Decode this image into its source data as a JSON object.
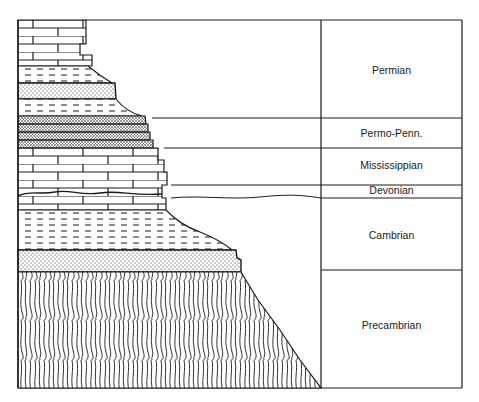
{
  "figure": {
    "type": "stratigraphic-column",
    "periods": [
      {
        "name": "Permian",
        "top": 20,
        "bottom": 118,
        "label_y": 64
      },
      {
        "name": "Permo-Penn.",
        "top": 118,
        "bottom": 148,
        "label_y": 127
      },
      {
        "name": "Mississippian",
        "top": 148,
        "bottom": 185,
        "label_y": 159
      },
      {
        "name": "Devonian",
        "top": 185,
        "bottom": 198,
        "label_y": 185
      },
      {
        "name": "Cambrian",
        "top": 198,
        "bottom": 270,
        "label_y": 229
      },
      {
        "name": "Precambrian",
        "top": 270,
        "bottom": 388,
        "label_y": 319
      }
    ],
    "lithology_layers": [
      {
        "rock": "limestone",
        "pattern": "brick",
        "top": 20,
        "bottom": 66
      },
      {
        "rock": "shale",
        "pattern": "dashes",
        "top": 66,
        "bottom": 83
      },
      {
        "rock": "sandstone",
        "pattern": "dots",
        "top": 83,
        "bottom": 99
      },
      {
        "rock": "shale",
        "pattern": "dashes",
        "top": 99,
        "bottom": 116
      },
      {
        "rock": "sandy-limestone",
        "pattern": "dense-dots",
        "top": 116,
        "bottom": 148
      },
      {
        "rock": "limestone",
        "pattern": "brick",
        "top": 148,
        "bottom": 210
      },
      {
        "rock": "shale",
        "pattern": "dashes",
        "top": 210,
        "bottom": 250
      },
      {
        "rock": "sandstone",
        "pattern": "dots",
        "top": 250,
        "bottom": 272
      },
      {
        "rock": "schist/basement",
        "pattern": "wavy-vertical",
        "top": 272,
        "bottom": 388
      }
    ],
    "colors": {
      "ink": "#1a1a1a",
      "paper": "#ffffff"
    }
  }
}
